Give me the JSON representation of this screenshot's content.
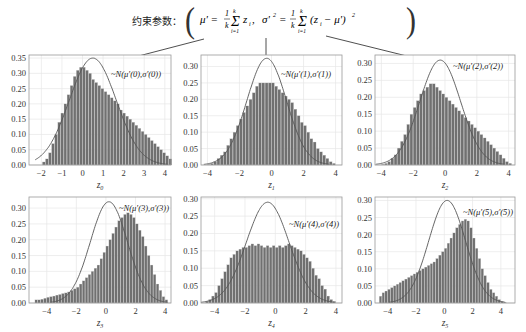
{
  "header": {
    "label": "约束参数：",
    "formula": "μ' = (1/k) Σ_{i=1}^{k} z_i ,  σ'² = (1/k) Σ_{i=1}^{k} (z_i − μ')²"
  },
  "style": {
    "bar_color": "#707070",
    "bar_edge": "#d8d8d8",
    "curve_color": "#555555",
    "grid_color": "#e6e6e6",
    "axis_color": "#999999"
  },
  "chart_data": [
    {
      "type": "bar",
      "title": "",
      "xlabel": "z0",
      "legend": "~N(μ'(0),σ'(0))",
      "xlim": [
        -2.6,
        4.3
      ],
      "ylim": [
        0,
        0.36
      ],
      "xticks": [
        -2,
        -1,
        0,
        1,
        2,
        3,
        4
      ],
      "yticks": [
        "0.00",
        "0.05",
        "0.10",
        "0.15",
        "0.20",
        "0.25",
        "0.30",
        "0.35"
      ],
      "gauss": {
        "mu": 0.5,
        "peak": 0.35,
        "sigma": 1.14
      },
      "bins_start": -1.95,
      "bin_width": 0.15,
      "values": [
        0.01,
        0.02,
        0.04,
        0.07,
        0.1,
        0.14,
        0.17,
        0.2,
        0.23,
        0.26,
        0.29,
        0.31,
        0.32,
        0.32,
        0.31,
        0.3,
        0.28,
        0.27,
        0.26,
        0.25,
        0.24,
        0.23,
        0.22,
        0.21,
        0.2,
        0.18,
        0.17,
        0.16,
        0.15,
        0.14,
        0.13,
        0.12,
        0.11,
        0.1,
        0.09,
        0.08,
        0.07,
        0.06,
        0.05,
        0.04,
        0.03,
        0.02
      ],
      "grid": true
    },
    {
      "type": "bar",
      "xlabel": "z1",
      "legend": "~N(μ'(1),σ'(1))",
      "xlim": [
        -4.4,
        4.4
      ],
      "ylim": [
        0,
        0.335
      ],
      "xticks": [
        -4,
        -2,
        0,
        2,
        4
      ],
      "yticks": [
        "0.00",
        "0.05",
        "0.10",
        "0.15",
        "0.20",
        "0.25",
        "0.30"
      ],
      "gauss": {
        "mu": -0.3,
        "peak": 0.325,
        "sigma": 1.23
      },
      "bins_start": -4.0,
      "bin_width": 0.2,
      "values": [
        0.002,
        0.005,
        0.01,
        0.02,
        0.03,
        0.04,
        0.06,
        0.08,
        0.1,
        0.12,
        0.14,
        0.16,
        0.18,
        0.2,
        0.22,
        0.24,
        0.25,
        0.25,
        0.25,
        0.25,
        0.25,
        0.24,
        0.23,
        0.22,
        0.21,
        0.2,
        0.19,
        0.17,
        0.15,
        0.13,
        0.12,
        0.1,
        0.08,
        0.07,
        0.05,
        0.04,
        0.03,
        0.02,
        0.01,
        0.005
      ],
      "grid": true
    },
    {
      "type": "bar",
      "xlabel": "z2",
      "legend": "~N(μ'(2),σ'(2))",
      "xlim": [
        -4.4,
        4.4
      ],
      "ylim": [
        0,
        0.325
      ],
      "xticks": [
        -4,
        -2,
        0,
        2,
        4
      ],
      "yticks": [
        "0.00",
        "0.05",
        "0.10",
        "0.15",
        "0.20",
        "0.25",
        "0.30"
      ],
      "gauss": {
        "mu": -0.3,
        "peak": 0.31,
        "sigma": 1.28
      },
      "bins_start": -4.0,
      "bin_width": 0.2,
      "values": [
        0.002,
        0.005,
        0.01,
        0.02,
        0.03,
        0.05,
        0.07,
        0.09,
        0.12,
        0.15,
        0.17,
        0.19,
        0.21,
        0.22,
        0.23,
        0.24,
        0.24,
        0.23,
        0.22,
        0.21,
        0.2,
        0.19,
        0.18,
        0.17,
        0.16,
        0.15,
        0.14,
        0.13,
        0.12,
        0.11,
        0.1,
        0.09,
        0.08,
        0.07,
        0.06,
        0.05,
        0.04,
        0.03,
        0.02,
        0.01,
        0.005
      ],
      "grid": true
    },
    {
      "type": "bar",
      "xlabel": "z3",
      "legend": "~N(μ'(3),σ'(3))",
      "xlim": [
        -5.2,
        4.4
      ],
      "ylim": [
        0,
        0.335
      ],
      "xticks": [
        -4,
        -2,
        0,
        2,
        4
      ],
      "yticks": [
        "0.00",
        "0.05",
        "0.10",
        "0.15",
        "0.20",
        "0.25",
        "0.30"
      ],
      "gauss": {
        "mu": 0.2,
        "peak": 0.32,
        "sigma": 1.25
      },
      "bins_start": -4.8,
      "bin_width": 0.2,
      "values": [
        0.01,
        0.01,
        0.012,
        0.015,
        0.018,
        0.02,
        0.022,
        0.025,
        0.027,
        0.03,
        0.032,
        0.035,
        0.04,
        0.045,
        0.05,
        0.06,
        0.07,
        0.08,
        0.09,
        0.1,
        0.11,
        0.12,
        0.14,
        0.16,
        0.18,
        0.2,
        0.22,
        0.24,
        0.26,
        0.27,
        0.28,
        0.285,
        0.28,
        0.27,
        0.25,
        0.23,
        0.21,
        0.18,
        0.15,
        0.12,
        0.09,
        0.06,
        0.04,
        0.02,
        0.01
      ],
      "grid": true
    },
    {
      "type": "bar",
      "xlabel": "z4",
      "legend": "~N(μ'(4),σ'(4))",
      "xlim": [
        -4.9,
        4.4
      ],
      "ylim": [
        0,
        0.305
      ],
      "xticks": [
        -4,
        -2,
        0,
        2,
        4
      ],
      "yticks": [
        "0.00",
        "0.05",
        "0.10",
        "0.15",
        "0.20",
        "0.25",
        "0.30"
      ],
      "gauss": {
        "mu": -0.5,
        "peak": 0.29,
        "sigma": 1.4
      },
      "bins_start": -4.6,
      "bin_width": 0.2,
      "values": [
        0.005,
        0.01,
        0.02,
        0.03,
        0.05,
        0.07,
        0.09,
        0.11,
        0.13,
        0.14,
        0.15,
        0.155,
        0.16,
        0.16,
        0.165,
        0.17,
        0.165,
        0.17,
        0.165,
        0.16,
        0.165,
        0.16,
        0.165,
        0.16,
        0.165,
        0.16,
        0.165,
        0.17,
        0.165,
        0.16,
        0.155,
        0.15,
        0.14,
        0.13,
        0.12,
        0.1,
        0.08,
        0.07,
        0.05,
        0.04,
        0.02,
        0.01,
        0.005
      ],
      "grid": true
    },
    {
      "type": "bar",
      "xlabel": "z5",
      "legend": "~N(μ'(5),σ'(5))",
      "xlim": [
        -4.9,
        5.0
      ],
      "ylim": [
        0,
        0.31
      ],
      "xticks": [
        -4,
        -2,
        0,
        2,
        4
      ],
      "yticks": [
        "0.00",
        "0.05",
        "0.10",
        "0.15",
        "0.20",
        "0.25",
        "0.30"
      ],
      "gauss": {
        "mu": 0.2,
        "peak": 0.3,
        "sigma": 1.3
      },
      "bins_start": -4.6,
      "bin_width": 0.2,
      "values": [
        0.02,
        0.03,
        0.035,
        0.04,
        0.045,
        0.05,
        0.055,
        0.06,
        0.065,
        0.07,
        0.075,
        0.08,
        0.085,
        0.09,
        0.095,
        0.1,
        0.105,
        0.11,
        0.115,
        0.12,
        0.13,
        0.14,
        0.15,
        0.16,
        0.175,
        0.19,
        0.205,
        0.22,
        0.23,
        0.24,
        0.245,
        0.24,
        0.22,
        0.19,
        0.16,
        0.13,
        0.1,
        0.08,
        0.06,
        0.04,
        0.03,
        0.02,
        0.01,
        0.005,
        0.002
      ],
      "grid": true
    }
  ]
}
